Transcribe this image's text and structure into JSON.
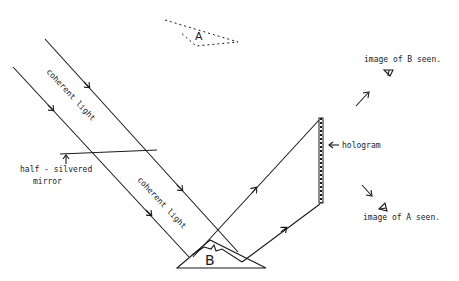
{
  "diagram": {
    "type": "holography-setup",
    "labels": {
      "coherent_light_1": "coherent light",
      "coherent_light_2": "coherent light",
      "half_silvered_mirror_line1": "half - silvered",
      "half_silvered_mirror_line2": "mirror",
      "hologram": "hologram",
      "object_B": "B",
      "virtual_object_A": "A",
      "image_of_B_seen": "image of B seen.",
      "image_of_A_seen": "image of A seen."
    },
    "components": [
      {
        "id": "incident-beam-upper",
        "kind": "light-ray"
      },
      {
        "id": "incident-beam-lower",
        "kind": "light-ray"
      },
      {
        "id": "half-silvered-mirror",
        "kind": "mirror"
      },
      {
        "id": "object-B",
        "kind": "object"
      },
      {
        "id": "reflected-beam-1",
        "kind": "light-ray"
      },
      {
        "id": "reflected-beam-2",
        "kind": "light-ray"
      },
      {
        "id": "hologram-plate",
        "kind": "plate"
      },
      {
        "id": "virtual-object-A",
        "kind": "virtual-image"
      },
      {
        "id": "eye-B",
        "kind": "observer"
      },
      {
        "id": "eye-A",
        "kind": "observer"
      }
    ]
  }
}
